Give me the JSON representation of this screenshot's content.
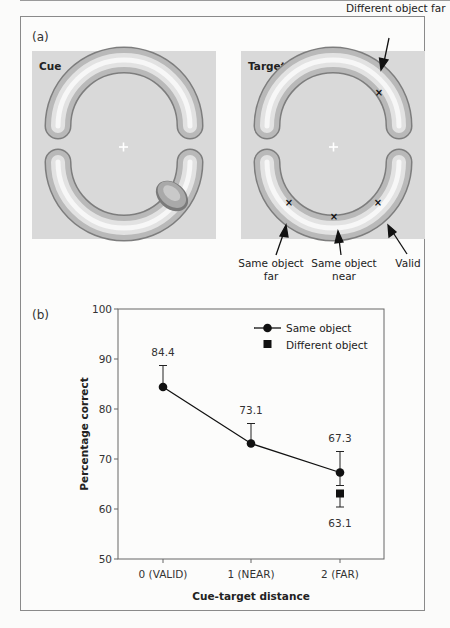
{
  "panel_a": {
    "label": "(a)",
    "cue_box": {
      "title": "Cue"
    },
    "target_box": {
      "title": "Target"
    },
    "annotations": {
      "different_far": "Different object far",
      "same_far_line1": "Same object",
      "same_far_line2": "far",
      "same_near_line1": "Same object",
      "same_near_line2": "near",
      "valid": "Valid"
    },
    "colors": {
      "box_bg": "#d8d8d8",
      "fixation": "#ffffff"
    }
  },
  "panel_b": {
    "label": "(b)"
  },
  "chart_data": {
    "type": "line",
    "title": "",
    "xlabel": "Cue-target distance",
    "ylabel": "Percentage correct",
    "categories": [
      "0 (VALID)",
      "1 (NEAR)",
      "2 (FAR)"
    ],
    "ylim": [
      50,
      100
    ],
    "yticks": [
      50,
      60,
      70,
      80,
      90,
      100
    ],
    "grid": false,
    "legend_position": "top-right",
    "series": [
      {
        "name": "Same object",
        "marker": "circle",
        "line": true,
        "values": [
          84.4,
          73.1,
          67.3
        ],
        "labels": [
          "84.4",
          "73.1",
          "67.3"
        ],
        "error_upper": [
          88.7,
          77.1,
          71.5
        ],
        "error_lower": [
          null,
          null,
          64.7
        ]
      },
      {
        "name": "Different object",
        "marker": "square",
        "line": false,
        "values": [
          null,
          null,
          63.1
        ],
        "labels": [
          null,
          null,
          "63.1"
        ],
        "error_upper": [
          null,
          null,
          null
        ],
        "error_lower": [
          null,
          null,
          60.4
        ]
      }
    ]
  }
}
